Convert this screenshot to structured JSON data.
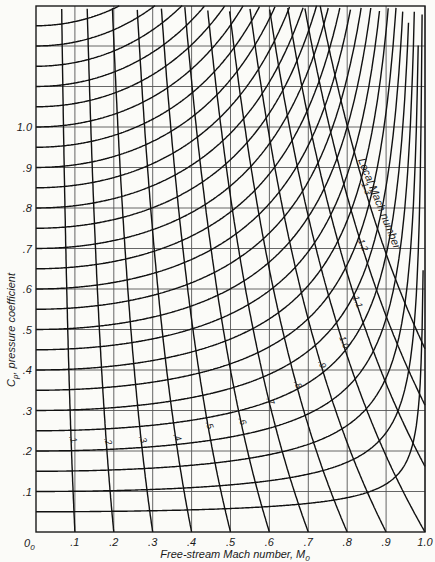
{
  "chart_data": {
    "type": "line",
    "title": "",
    "xlabel": "Free-stream Mach number, M",
    "xlabel_subscript": "0",
    "ylabel": "C",
    "ylabel_subscript": "p",
    "ylabel_rest": ", pressure coefficient",
    "xlim": [
      0,
      1.0
    ],
    "ylim": [
      0,
      1.3
    ],
    "grid": true,
    "x_ticks": [
      {
        "value": 0.1,
        "label": ".1"
      },
      {
        "value": 0.2,
        "label": ".2"
      },
      {
        "value": 0.3,
        "label": ".3"
      },
      {
        "value": 0.4,
        "label": ".4"
      },
      {
        "value": 0.5,
        "label": ".5"
      },
      {
        "value": 0.6,
        "label": ".6"
      },
      {
        "value": 0.7,
        "label": ".7"
      },
      {
        "value": 0.8,
        "label": ".8"
      },
      {
        "value": 0.9,
        "label": ".9"
      },
      {
        "value": 1.0,
        "label": "1.0"
      }
    ],
    "y_ticks": [
      {
        "value": 0.1,
        "label": ".1"
      },
      {
        "value": 0.2,
        "label": ".2"
      },
      {
        "value": 0.3,
        "label": ".3"
      },
      {
        "value": 0.4,
        "label": ".4"
      },
      {
        "value": 0.5,
        "label": ".5"
      },
      {
        "value": 0.6,
        "label": ".6"
      },
      {
        "value": 0.7,
        "label": ".7"
      },
      {
        "value": 0.8,
        "label": ".8"
      },
      {
        "value": 0.9,
        "label": ".9"
      },
      {
        "value": 1.0,
        "label": "1.0"
      }
    ],
    "origin_label": "0",
    "origin_subscript": "0",
    "families": [
      {
        "name": "Constant incompressible pressure coefficient (Karman-Tsien)",
        "description": "Curves start at M0=0 at Cp values 0.05 to 1.30 in steps of 0.05 and rise with M0",
        "start_values": [
          0.05,
          0.1,
          0.15,
          0.2,
          0.25,
          0.3,
          0.35,
          0.4,
          0.45,
          0.5,
          0.55,
          0.6,
          0.65,
          0.7,
          0.75,
          0.8,
          0.85,
          0.9,
          0.95,
          1.0,
          1.05,
          1.1,
          1.15,
          1.2,
          1.25,
          1.3
        ]
      },
      {
        "name": "Local Mach number",
        "description": "Curves of constant local Mach number; each meets Cp=0 at M0 equal to the local Mach number",
        "values": [
          0.1,
          0.2,
          0.3,
          0.4,
          0.5,
          0.6,
          0.7,
          0.8,
          0.9,
          1.0,
          1.1,
          1.2,
          1.3
        ],
        "labels": [
          ".1",
          ".2",
          ".3",
          ".4",
          ".5",
          ".6",
          ".7",
          ".8",
          ".9",
          "1.0",
          "1.1",
          "1.2",
          "1.3"
        ],
        "annotation": "Local Mach number"
      }
    ]
  }
}
